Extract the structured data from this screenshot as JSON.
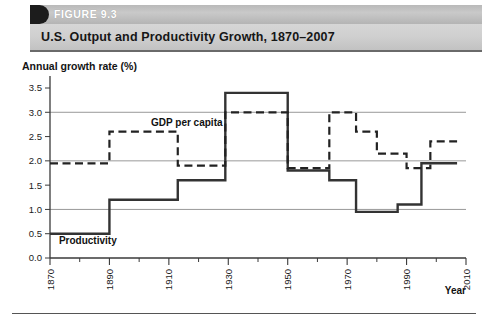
{
  "figure": {
    "number_label": "FIGURE 9.3",
    "title": "U.S. Output and Productivity Growth, 1870–2007"
  },
  "chart_data": {
    "type": "line",
    "title": "U.S. Output and Productivity Growth, 1870–2007",
    "subtitle": "",
    "xlabel": "Year",
    "ylabel": "Annual growth rate (%)",
    "xlim": [
      1870,
      2010
    ],
    "ylim": [
      0.0,
      3.5
    ],
    "grid": true,
    "grid_values": [
      1.0,
      2.0,
      3.0
    ],
    "legend_position": "inline-annotation",
    "step_style": "post",
    "yticks": [
      "0.0",
      "0.5",
      "1.0",
      "1.5",
      "2.0",
      "2.5",
      "3.0",
      "3.5"
    ],
    "ytick_values": [
      0.0,
      0.5,
      1.0,
      1.5,
      2.0,
      2.5,
      3.0,
      3.5
    ],
    "xticks": [
      "1870",
      "1890",
      "1910",
      "1930",
      "1950",
      "1970",
      "1990",
      "2010"
    ],
    "xtick_values": [
      1870,
      1890,
      1910,
      1930,
      1950,
      1970,
      1990,
      2010
    ],
    "xminor_values": [
      1880,
      1900,
      1920,
      1940,
      1960,
      1980,
      2000
    ],
    "series": [
      {
        "name": "Productivity",
        "style": "solid",
        "color": "#333333",
        "label_x": 1873,
        "label_y": 0.28,
        "segments": [
          {
            "x0": 1870,
            "x1": 1890,
            "value": 0.5
          },
          {
            "x0": 1890,
            "x1": 1913,
            "value": 1.2
          },
          {
            "x0": 1913,
            "x1": 1929,
            "value": 1.6
          },
          {
            "x0": 1929,
            "x1": 1950,
            "value": 3.4
          },
          {
            "x0": 1950,
            "x1": 1964,
            "value": 1.8
          },
          {
            "x0": 1964,
            "x1": 1973,
            "value": 1.6
          },
          {
            "x0": 1973,
            "x1": 1987,
            "value": 0.95
          },
          {
            "x0": 1987,
            "x1": 1995,
            "value": 1.1
          },
          {
            "x0": 1995,
            "x1": 2007,
            "value": 1.95
          }
        ]
      },
      {
        "name": "GDP per capita",
        "style": "dashed",
        "color": "#222222",
        "label_x": 1904,
        "label_y": 2.72,
        "segments": [
          {
            "x0": 1870,
            "x1": 1890,
            "value": 1.95
          },
          {
            "x0": 1890,
            "x1": 1913,
            "value": 2.6
          },
          {
            "x0": 1913,
            "x1": 1929,
            "value": 1.9
          },
          {
            "x0": 1929,
            "x1": 1950,
            "value": 3.0
          },
          {
            "x0": 1950,
            "x1": 1964,
            "value": 1.85
          },
          {
            "x0": 1964,
            "x1": 1973,
            "value": 3.0
          },
          {
            "x0": 1973,
            "x1": 1980,
            "value": 2.6
          },
          {
            "x0": 1980,
            "x1": 1990,
            "value": 2.15
          },
          {
            "x0": 1990,
            "x1": 1998,
            "value": 1.85
          },
          {
            "x0": 1998,
            "x1": 2007,
            "value": 2.4
          }
        ]
      }
    ]
  }
}
